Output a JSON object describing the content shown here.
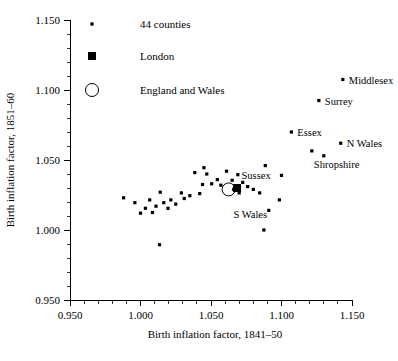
{
  "chart_data": {
    "type": "scatter",
    "title": "",
    "xlabel": "Birth inflation factor, 1841–50",
    "ylabel": "Birth inflation factor, 1851–60",
    "xlim": [
      0.95,
      1.15
    ],
    "ylim": [
      0.95,
      1.15
    ],
    "xticks": [
      "0.950",
      "1.000",
      "1.050",
      "1.100",
      "1.150"
    ],
    "yticks": [
      "0.950",
      "1.000",
      "1.050",
      "1.100",
      "1.150"
    ],
    "xtick_values": [
      0.95,
      1.0,
      1.05,
      1.1,
      1.15
    ],
    "ytick_values": [
      0.95,
      1.0,
      1.05,
      1.1,
      1.15
    ],
    "minor_ticks_per_interval": 4,
    "grid": false,
    "legend_position": "top-left-inside",
    "legend": [
      {
        "label": "44 counties",
        "marker": "small-dot"
      },
      {
        "label": "London",
        "marker": "filled-square"
      },
      {
        "label": "England and Wales",
        "marker": "open-circle"
      }
    ],
    "series": [
      {
        "name": "44 counties",
        "marker": "small-dot",
        "points": [
          {
            "x": 1.1435,
            "y": 1.1075,
            "label": "Middlesex",
            "label_pos": "right"
          },
          {
            "x": 1.1265,
            "y": 1.0925,
            "label": "Surrey",
            "label_pos": "right"
          },
          {
            "x": 1.107,
            "y": 1.07,
            "label": "Essex",
            "label_pos": "right"
          },
          {
            "x": 1.142,
            "y": 1.062,
            "label": "N Wales",
            "label_pos": "right"
          },
          {
            "x": 1.1215,
            "y": 1.0565,
            "label": "Shropshire",
            "label_pos": "right"
          },
          {
            "x": 1.13,
            "y": 1.053,
            "label": "",
            "label_pos": ""
          },
          {
            "x": 1.1,
            "y": 1.039,
            "label": "Sussex",
            "label_pos": "right"
          },
          {
            "x": 1.0985,
            "y": 1.0215,
            "label": "S Wales",
            "label_pos": "right"
          },
          {
            "x": 1.065,
            "y": 1.0355,
            "label": "",
            "label_pos": ""
          },
          {
            "x": 1.069,
            "y": 1.0395,
            "label": "",
            "label_pos": ""
          },
          {
            "x": 1.0725,
            "y": 1.034,
            "label": "",
            "label_pos": ""
          },
          {
            "x": 1.076,
            "y": 1.031,
            "label": "",
            "label_pos": ""
          },
          {
            "x": 1.08,
            "y": 1.029,
            "label": "",
            "label_pos": ""
          },
          {
            "x": 1.0845,
            "y": 1.0265,
            "label": "",
            "label_pos": ""
          },
          {
            "x": 1.066,
            "y": 1.029,
            "label": "",
            "label_pos": ""
          },
          {
            "x": 1.07,
            "y": 1.0265,
            "label": "",
            "label_pos": ""
          },
          {
            "x": 1.061,
            "y": 1.042,
            "label": "",
            "label_pos": ""
          },
          {
            "x": 1.057,
            "y": 1.032,
            "label": "",
            "label_pos": ""
          },
          {
            "x": 1.0545,
            "y": 1.036,
            "label": "",
            "label_pos": ""
          },
          {
            "x": 1.0505,
            "y": 1.033,
            "label": "",
            "label_pos": ""
          },
          {
            "x": 1.047,
            "y": 1.04,
            "label": "",
            "label_pos": ""
          },
          {
            "x": 1.044,
            "y": 1.0325,
            "label": "",
            "label_pos": ""
          },
          {
            "x": 1.042,
            "y": 1.026,
            "label": "",
            "label_pos": ""
          },
          {
            "x": 1.0385,
            "y": 1.041,
            "label": "",
            "label_pos": ""
          },
          {
            "x": 1.035,
            "y": 1.0245,
            "label": "",
            "label_pos": ""
          },
          {
            "x": 1.031,
            "y": 1.0225,
            "label": "",
            "label_pos": ""
          },
          {
            "x": 1.029,
            "y": 1.0265,
            "label": "",
            "label_pos": ""
          },
          {
            "x": 1.025,
            "y": 1.0185,
            "label": "",
            "label_pos": ""
          },
          {
            "x": 1.0215,
            "y": 1.0215,
            "label": "",
            "label_pos": ""
          },
          {
            "x": 1.0195,
            "y": 1.0155,
            "label": "",
            "label_pos": ""
          },
          {
            "x": 1.0165,
            "y": 1.0195,
            "label": "",
            "label_pos": ""
          },
          {
            "x": 1.014,
            "y": 1.027,
            "label": "",
            "label_pos": ""
          },
          {
            "x": 1.011,
            "y": 1.017,
            "label": "",
            "label_pos": ""
          },
          {
            "x": 1.0085,
            "y": 1.0125,
            "label": "",
            "label_pos": ""
          },
          {
            "x": 1.0065,
            "y": 1.0215,
            "label": "",
            "label_pos": ""
          },
          {
            "x": 1.0035,
            "y": 1.0155,
            "label": "",
            "label_pos": ""
          },
          {
            "x": 1.0,
            "y": 1.012,
            "label": "",
            "label_pos": ""
          },
          {
            "x": 0.996,
            "y": 1.0195,
            "label": "",
            "label_pos": ""
          },
          {
            "x": 0.988,
            "y": 1.023,
            "label": "",
            "label_pos": ""
          },
          {
            "x": 1.0135,
            "y": 0.9895,
            "label": "",
            "label_pos": ""
          },
          {
            "x": 1.0875,
            "y": 1.0,
            "label": "",
            "label_pos": ""
          },
          {
            "x": 1.091,
            "y": 1.014,
            "label": "",
            "label_pos": ""
          },
          {
            "x": 1.045,
            "y": 1.0445,
            "label": "",
            "label_pos": ""
          },
          {
            "x": 1.0885,
            "y": 1.046,
            "label": "",
            "label_pos": ""
          }
        ]
      },
      {
        "name": "London",
        "marker": "filled-square",
        "points": [
          {
            "x": 1.0685,
            "y": 1.03,
            "label": "",
            "label_pos": ""
          }
        ]
      },
      {
        "name": "England and Wales",
        "marker": "open-circle",
        "points": [
          {
            "x": 1.0625,
            "y": 1.029,
            "label": "",
            "label_pos": ""
          }
        ]
      }
    ]
  },
  "caption": {
    "text": ""
  }
}
